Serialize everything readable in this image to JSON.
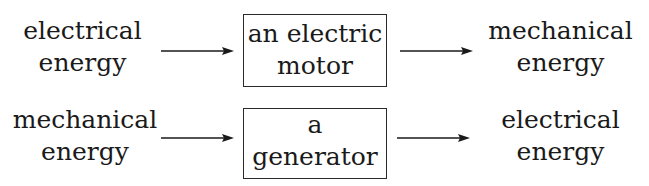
{
  "diagram": {
    "rows": [
      {
        "input": {
          "line1": "electrical",
          "line2": "energy"
        },
        "device": {
          "line1": "an electric",
          "line2": "motor"
        },
        "output": {
          "line1": "mechanical",
          "line2": "energy"
        }
      },
      {
        "input": {
          "line1": "mechanical",
          "line2": "energy"
        },
        "device": {
          "line1": "a",
          "line2": "generator"
        },
        "output": {
          "line1": "electrical",
          "line2": "energy"
        }
      }
    ],
    "colors": {
      "ink": "#1a1a1a",
      "background": "#ffffff"
    }
  }
}
